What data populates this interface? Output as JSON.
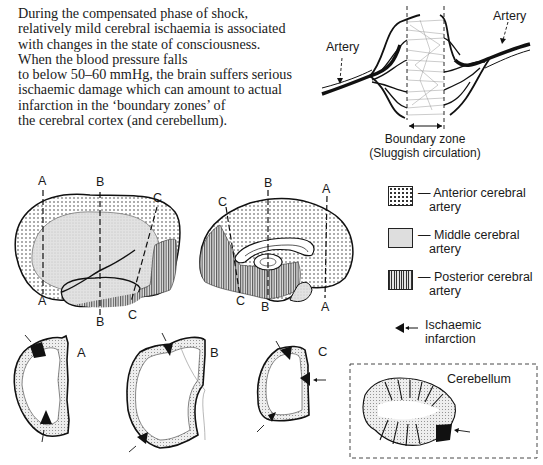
{
  "intro_text": {
    "lines": [
      "During the compensated phase of shock,",
      "relatively mild cerebral ischaemia is associated",
      "with changes in the state of consciousness.",
      "When the blood pressure falls",
      "to below 50–60 mmHg, the brain suffers serious",
      "ischaemic damage which can amount to actual",
      "infarction in the ‘boundary zones’ of",
      "the cerebral cortex (and cerebellum)."
    ]
  },
  "boundary_diagram": {
    "artery_left_label": "Artery",
    "artery_right_label": "Artery",
    "zone_label": "Boundary zone",
    "zone_sublabel": "(Sluggish circulation)"
  },
  "lateral_view": {
    "section_labels": {
      "a_top": "A",
      "a_bottom": "A",
      "b_top": "B",
      "b_bottom": "B",
      "c_top": "C",
      "c_bottom": "C"
    }
  },
  "medial_view": {
    "section_labels": {
      "a_top": "A",
      "a_bottom": "A",
      "b_top": "B",
      "b_bottom": "B",
      "c_top": "C",
      "c_bottom": "C"
    }
  },
  "legend": {
    "items": [
      {
        "pattern": "dotted",
        "line1": "— Anterior cerebral",
        "line2": "artery"
      },
      {
        "pattern": "stippled",
        "line1": "— Middle cerebral",
        "line2": "artery"
      },
      {
        "pattern": "vertical-hatch",
        "line1": "— Posterior cerebral",
        "line2": "artery"
      },
      {
        "pattern": "black-wedge-arrow",
        "line1": "Ischaemic",
        "line2": "infarction"
      }
    ]
  },
  "coronal_sections": [
    {
      "label": "A"
    },
    {
      "label": "B"
    },
    {
      "label": "C"
    }
  ],
  "cerebellum_box": {
    "label": "Cerebellum"
  },
  "colors": {
    "ink": "#1a1a1a",
    "stipple": "#d9d9d9",
    "background": "#ffffff"
  }
}
